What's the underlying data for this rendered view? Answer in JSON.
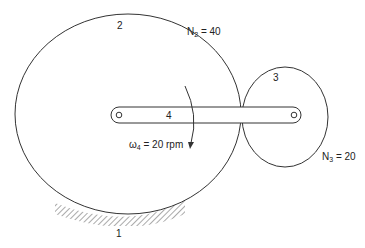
{
  "figure": {
    "links": {
      "ground": "1",
      "gear2": "2",
      "gear3": "3",
      "arm": "4"
    },
    "gear2_teeth": {
      "symbol": "N",
      "sub": "2",
      "eq": " = 40"
    },
    "gear3_teeth": {
      "symbol": "N",
      "sub": "3",
      "eq": " = 20"
    },
    "arm_speed": {
      "symbol": "ω",
      "sub": "4",
      "eq": " = 20 rpm"
    },
    "colors": {
      "line": "#333333",
      "hatch": "#555555",
      "background": "#ffffff"
    }
  }
}
